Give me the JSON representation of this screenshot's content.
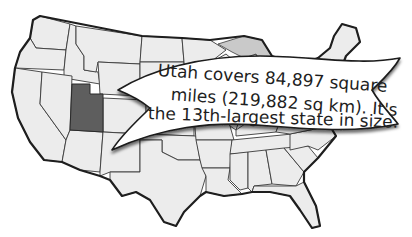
{
  "map": {
    "title": "Map of the contiguous United States",
    "highlighted_state": "Utah",
    "colors": {
      "highlight": "#5e5e5e",
      "states": "#ececec",
      "lakes": "#c9c9c9",
      "borders": "#3a3a3a",
      "banner": "#ffffff"
    }
  },
  "banner": {
    "lines": [
      "Utah covers 84,897 square",
      "miles (219,882 sq km). It's",
      "the 13th-largest state in size."
    ]
  }
}
